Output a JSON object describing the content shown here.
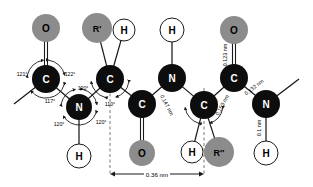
{
  "figure": {
    "colors": {
      "carbon_nitrogen_fill": "#0d0d0d",
      "oxygen_r_fill": "#8c8c8c",
      "hydrogen_fill": "#ffffff",
      "bond_stroke": "#1a1a1a",
      "label_dark": "#ffffff",
      "label_light": "#000000",
      "guide_line": "#555555"
    },
    "atoms": [
      {
        "id": "a1",
        "label": "O",
        "kind": "oxygen",
        "x": 46,
        "y": 28,
        "r": 14
      },
      {
        "id": "a2",
        "label": "C",
        "kind": "carbon",
        "x": 46,
        "y": 79,
        "r": 14
      },
      {
        "id": "a3",
        "label": "N",
        "kind": "nitrogen",
        "x": 79,
        "y": 107,
        "r": 13
      },
      {
        "id": "a4",
        "label": "H",
        "kind": "hydrogen",
        "x": 79,
        "y": 156,
        "r": 12
      },
      {
        "id": "a5",
        "label": "R'",
        "kind": "rgroup",
        "x": 97,
        "y": 28,
        "r": 15
      },
      {
        "id": "a6",
        "label": "H",
        "kind": "hydrogen",
        "x": 124,
        "y": 30,
        "r": 11
      },
      {
        "id": "a7",
        "label": "C",
        "kind": "carbon",
        "x": 110,
        "y": 79,
        "r": 14
      },
      {
        "id": "a8",
        "label": "C",
        "kind": "carbon",
        "x": 142,
        "y": 104,
        "r": 14
      },
      {
        "id": "a9",
        "label": "O",
        "kind": "oxygen",
        "x": 142,
        "y": 153,
        "r": 13
      },
      {
        "id": "a10",
        "label": "N",
        "kind": "nitrogen",
        "x": 172,
        "y": 78,
        "r": 14
      },
      {
        "id": "a11",
        "label": "H",
        "kind": "hydrogen",
        "x": 172,
        "y": 30,
        "r": 12
      },
      {
        "id": "a12",
        "label": "C",
        "kind": "carbon",
        "x": 204,
        "y": 105,
        "r": 14
      },
      {
        "id": "a13",
        "label": "H",
        "kind": "hydrogen",
        "x": 192,
        "y": 152,
        "r": 11
      },
      {
        "id": "a14",
        "label": "R″",
        "kind": "rgroup",
        "x": 219,
        "y": 152,
        "r": 15
      },
      {
        "id": "a15",
        "label": "C",
        "kind": "carbon",
        "x": 234,
        "y": 78,
        "r": 14
      },
      {
        "id": "a16",
        "label": "O",
        "kind": "oxygen",
        "x": 234,
        "y": 30,
        "r": 14
      },
      {
        "id": "a17",
        "label": "N",
        "kind": "nitrogen",
        "x": 266,
        "y": 104,
        "r": 14
      },
      {
        "id": "a18",
        "label": "H",
        "kind": "hydrogen",
        "x": 266,
        "y": 153,
        "r": 12
      }
    ],
    "angle_labels": [
      {
        "id": "ang1",
        "text": "121°",
        "x": 22,
        "y": 74
      },
      {
        "id": "ang2",
        "text": "122°",
        "x": 70,
        "y": 74
      },
      {
        "id": "ang3",
        "text": "117°",
        "x": 50,
        "y": 101
      },
      {
        "id": "ang4",
        "text": "120°",
        "x": 83,
        "y": 88
      },
      {
        "id": "ang5",
        "text": "120°",
        "x": 59,
        "y": 124
      },
      {
        "id": "ang6",
        "text": "120°",
        "x": 101,
        "y": 122
      },
      {
        "id": "ang7",
        "text": "110°",
        "x": 110,
        "y": 104
      }
    ],
    "length_labels": [
      {
        "id": "len1",
        "text": "0.147 nm",
        "x": 167,
        "y": 105,
        "rotate": 62
      },
      {
        "id": "len2",
        "text": "0.153 nm",
        "x": 222,
        "y": 105,
        "rotate": -62
      },
      {
        "id": "len3",
        "text": "0.123 nm",
        "x": 225,
        "y": 55,
        "rotate": -90
      },
      {
        "id": "len4",
        "text": "0.132 nm",
        "x": 254,
        "y": 87,
        "rotate": -38
      },
      {
        "id": "len5",
        "text": "0.1 nm",
        "x": 259,
        "y": 128,
        "rotate": -90
      }
    ],
    "dimension": {
      "id": "dim-repeat",
      "text": "0.36 nm",
      "x_start": 110,
      "x_end": 204,
      "y": 174,
      "guide_top": 88
    }
  }
}
